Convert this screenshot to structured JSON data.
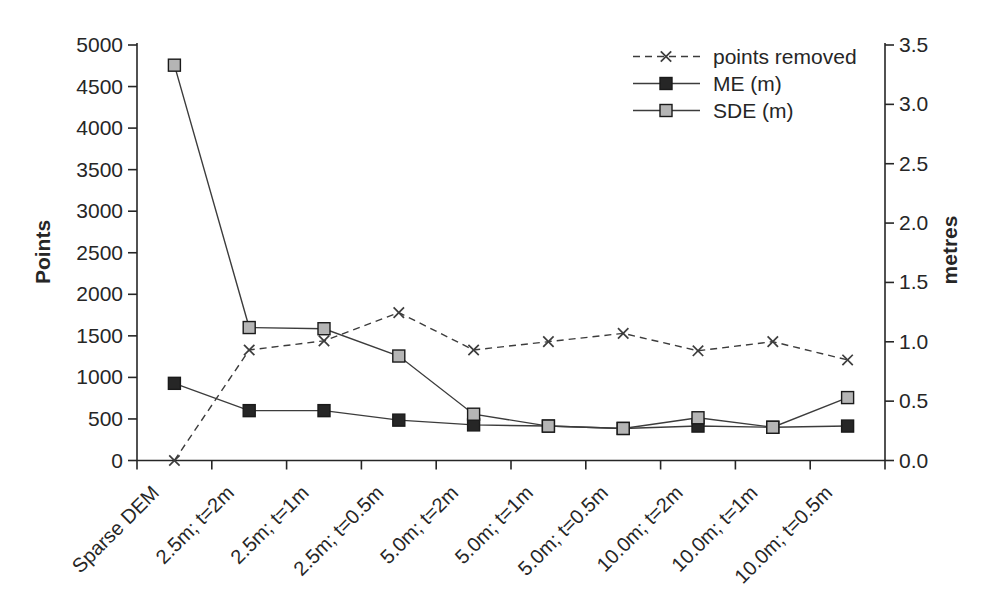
{
  "chart_data": {
    "type": "line",
    "title": "",
    "categories": [
      "Sparse DEM",
      "2.5m; t=2m",
      "2.5m; t=1m",
      "2.5m; t=0.5m",
      "5.0m; t=2m",
      "5.0m; t=1m",
      "5.0m; t=0.5m",
      "10.0m; t=2m",
      "10.0m; t=1m",
      "10.0m; t=0.5m"
    ],
    "x_tick_label_angle_deg": -45,
    "left_axis": {
      "label": "Points",
      "min": 0,
      "max": 5000,
      "step": 500,
      "tick_labels": [
        "0",
        "500",
        "1000",
        "1500",
        "2000",
        "2500",
        "3000",
        "3500",
        "4000",
        "4500",
        "5000"
      ]
    },
    "right_axis": {
      "label": "metres",
      "min": 0,
      "max": 3.5,
      "step": 0.5,
      "tick_labels": [
        "0.0",
        "0.5",
        "1.0",
        "1.5",
        "2.0",
        "2.5",
        "3.0",
        "3.5"
      ]
    },
    "series": [
      {
        "name": "points removed",
        "axis": "left",
        "line": "dashed",
        "marker": "x-cross",
        "color": "#3c3c3c",
        "values": [
          0,
          1330,
          1440,
          1780,
          1330,
          1430,
          1530,
          1320,
          1430,
          1210
        ]
      },
      {
        "name": "ME (m)",
        "axis": "right",
        "line": "solid",
        "marker": "square",
        "marker_fill": "#262626",
        "color": "#3c3c3c",
        "values": [
          0.65,
          0.42,
          0.42,
          0.34,
          0.3,
          0.29,
          0.27,
          0.29,
          0.28,
          0.29
        ]
      },
      {
        "name": "SDE (m)",
        "axis": "right",
        "line": "solid",
        "marker": "square",
        "marker_fill": "#b5b5b5",
        "color": "#3c3c3c",
        "values": [
          3.33,
          1.12,
          1.11,
          0.88,
          0.39,
          0.29,
          0.27,
          0.36,
          0.28,
          0.53
        ]
      }
    ],
    "legend": {
      "position": "top-right"
    },
    "grid": false,
    "background": "#ffffff",
    "text_color": "#262626"
  }
}
